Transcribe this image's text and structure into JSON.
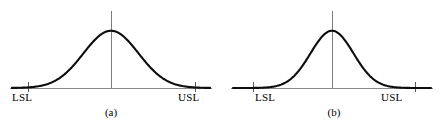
{
  "figure": {
    "background_color": "#ffffff",
    "curve_color": "#0d0d0d",
    "axis_color": "#8a8a8a",
    "center_line_color": "#7d7d7d",
    "tick_color": "#5a5a5a",
    "text_color": "#000000"
  },
  "panels": [
    {
      "id": "a",
      "caption": "(a)",
      "lsl_label": "LSL",
      "usl_label": "USL",
      "chart_data": {
        "type": "line",
        "title": "",
        "subtitle": "",
        "xlabel": "",
        "ylabel": "",
        "grid": false,
        "legend": "none",
        "distribution": "normal",
        "mean": 0,
        "std_dev": 1.0,
        "peak_height": 0.399,
        "xlim": [
          -3.6,
          3.6
        ],
        "ylim": [
          0,
          0.46
        ],
        "spec_limits": {
          "lsl": -3.0,
          "usl": 3.0
        },
        "center_line_x": 0,
        "annotations": [
          "LSL",
          "USL",
          "(a)"
        ],
        "x": [
          -3.6,
          -3.3,
          -3.0,
          -2.7,
          -2.4,
          -2.1,
          -1.8,
          -1.5,
          -1.2,
          -0.9,
          -0.6,
          -0.3,
          0.0,
          0.3,
          0.6,
          0.9,
          1.2,
          1.5,
          1.8,
          2.1,
          2.4,
          2.7,
          3.0,
          3.3,
          3.6
        ],
        "y": [
          0.001,
          0.002,
          0.004,
          0.01,
          0.022,
          0.044,
          0.079,
          0.13,
          0.194,
          0.266,
          0.333,
          0.381,
          0.399,
          0.381,
          0.333,
          0.266,
          0.194,
          0.13,
          0.079,
          0.044,
          0.022,
          0.01,
          0.004,
          0.002,
          0.001
        ]
      }
    },
    {
      "id": "b",
      "caption": "(b)",
      "lsl_label": "LSL",
      "usl_label": "USL",
      "chart_data": {
        "type": "line",
        "title": "",
        "subtitle": "",
        "xlabel": "",
        "ylabel": "",
        "grid": false,
        "legend": "none",
        "distribution": "normal",
        "mean": 0,
        "std_dev": 0.78,
        "peak_height": 0.399,
        "xlim": [
          -3.6,
          3.6
        ],
        "ylim": [
          0,
          0.46
        ],
        "spec_limits": {
          "lsl": -3.0,
          "usl": 3.0
        },
        "center_line_x": 0,
        "annotations": [
          "LSL",
          "USL",
          "(b)"
        ],
        "x": [
          -3.6,
          -3.3,
          -3.0,
          -2.7,
          -2.4,
          -2.1,
          -1.8,
          -1.5,
          -1.2,
          -0.9,
          -0.6,
          -0.3,
          0.0,
          0.3,
          0.6,
          0.9,
          1.2,
          1.5,
          1.8,
          2.1,
          2.4,
          2.7,
          3.0,
          3.3,
          3.6
        ],
        "y": [
          0.0,
          0.0,
          0.001,
          0.003,
          0.009,
          0.024,
          0.053,
          0.102,
          0.173,
          0.257,
          0.333,
          0.38,
          0.399,
          0.38,
          0.333,
          0.257,
          0.173,
          0.102,
          0.053,
          0.024,
          0.009,
          0.003,
          0.001,
          0.0,
          0.0
        ]
      }
    }
  ]
}
